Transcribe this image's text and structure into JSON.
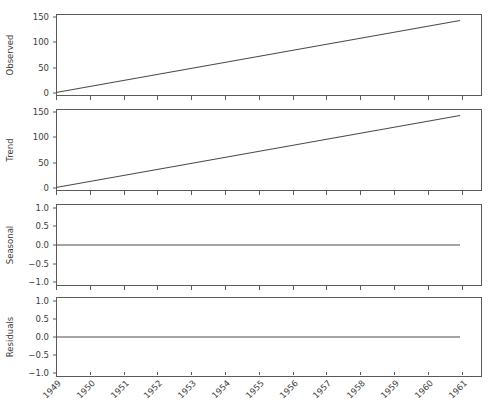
{
  "figure": {
    "background": "#ffffff",
    "line_color": "#4a4a4a",
    "axis_color": "#5a5a5a",
    "text_color": "#3c3c3c"
  },
  "chart_data": {
    "type": "line",
    "title": "",
    "xlabel": "",
    "grid": false,
    "legend": null,
    "x_tick_labels": [
      "1949",
      "1950",
      "1951",
      "1952",
      "1953",
      "1954",
      "1955",
      "1956",
      "1957",
      "1958",
      "1959",
      "1960",
      "1961"
    ],
    "x_range": [
      1949,
      1961.6
    ],
    "panels": [
      {
        "ylabel": "Observed",
        "ylim": [
          -7,
          157
        ],
        "y_ticks": [
          0,
          50,
          100,
          150
        ],
        "y_tick_labels": [
          "0",
          "50",
          "100",
          "150"
        ],
        "x": [
          1949.0,
          1960.95
        ],
        "values": [
          0,
          144
        ]
      },
      {
        "ylabel": "Trend",
        "ylim": [
          -7,
          157
        ],
        "y_ticks": [
          0,
          50,
          100,
          150
        ],
        "y_tick_labels": [
          "0",
          "50",
          "100",
          "150"
        ],
        "x": [
          1949.0,
          1960.95
        ],
        "values": [
          0,
          144
        ]
      },
      {
        "ylabel": "Seasonal",
        "ylim": [
          -1.1,
          1.1
        ],
        "y_ticks": [
          -1.0,
          -0.5,
          0.0,
          0.5,
          1.0
        ],
        "y_tick_labels": [
          "−1.0",
          "−0.5",
          "0.0",
          "0.5",
          "1.0"
        ],
        "x": [
          1949.0,
          1960.95
        ],
        "values": [
          0.0,
          0.0
        ]
      },
      {
        "ylabel": "Residuals",
        "ylim": [
          -1.1,
          1.1
        ],
        "y_ticks": [
          -1.0,
          -0.5,
          0.0,
          0.5,
          1.0
        ],
        "y_tick_labels": [
          "−1.0",
          "−0.5",
          "0.0",
          "0.5",
          "1.0"
        ],
        "x": [
          1949.0,
          1960.95
        ],
        "values": [
          0.0,
          0.0
        ]
      }
    ]
  }
}
